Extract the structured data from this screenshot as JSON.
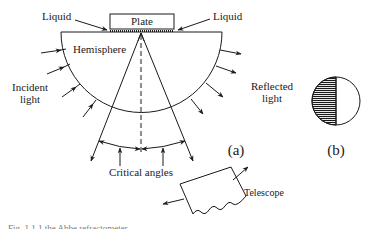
{
  "figure": {
    "panel_a": {
      "label": "(a)",
      "plate_label": "Plate",
      "liquid_left_label": "Liquid",
      "liquid_right_label": "Liquid",
      "hemisphere_label": "Hemisphere",
      "incident_label_line1": "Incident",
      "incident_label_line2": "light",
      "reflected_label_line1": "Reflected",
      "reflected_label_line2": "light",
      "critical_angles_label": "Critical angles",
      "telescope_label": "Telescope"
    },
    "panel_b": {
      "label": "(b)",
      "description": "field of view: left half shaded, right half bright"
    },
    "caption": "Fig. 1.1.1 the Abbe refractometer"
  },
  "colors": {
    "ink": "#1a1a1a",
    "background": "#ffffff"
  }
}
